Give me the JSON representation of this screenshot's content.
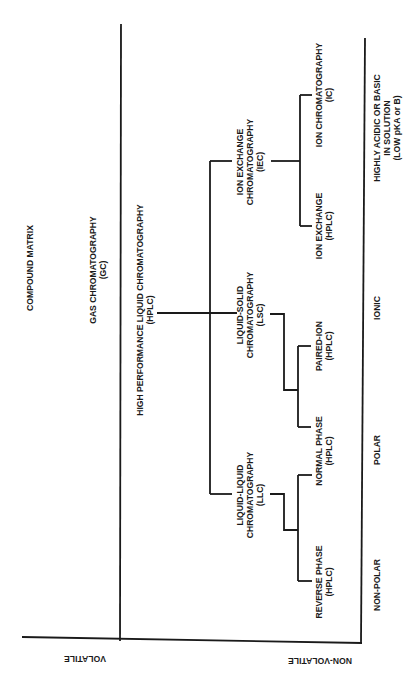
{
  "title": "COMPOUND MATRIX",
  "axes": {
    "volatility": {
      "volatile": "VOLATILE",
      "non_volatile": "NON-VOLATILE"
    },
    "polarity": {
      "non_polar": "NON-POLAR",
      "polar": "POLAR",
      "ionic": "IONIC",
      "highly_acidic_basic": {
        "line1": "HIGHLY ACIDIC OR BASIC",
        "line2": "IN SOLUTION",
        "line3": "(LOW pKA or B)"
      }
    }
  },
  "nodes": {
    "gc": {
      "line1": "GAS CHROMATOGRAPHY",
      "line2": "(GC)"
    },
    "hplc": {
      "line1": "HIGH PERFORMANCE LIQUID CHROMATOGRAPHY",
      "line2": "(HPLC)"
    },
    "iec": {
      "line1": "ION EXCHANGE",
      "line2": "CHROMATOGRAPHY",
      "line3": "(IEC)"
    },
    "lsc": {
      "line1": "LIQUID-SOLID",
      "line2": "CHROMATOGRAPHY",
      "line3": "(LSC)"
    },
    "llc": {
      "line1": "LIQUID-LIQUID",
      "line2": "CHROMATOGRAPHY",
      "line3": "(LLC)"
    },
    "ic": {
      "line1": "ION CHROMATOGRAPHY",
      "line2": "(IC)"
    },
    "ion_exchange_hplc": {
      "line1": "ION EXCHANGE",
      "line2": "(HPLC)"
    },
    "paired_ion": {
      "line1": "PAIRED-ION",
      "line2": "(HPLC)"
    },
    "normal_phase": {
      "line1": "NORMAL PHASE",
      "line2": "(HPLC)"
    },
    "reverse_phase": {
      "line1": "REVERSE PHASE",
      "line2": "(HPLC)"
    }
  },
  "colors": {
    "ink": "#1a1a1a",
    "background": "#ffffff"
  }
}
